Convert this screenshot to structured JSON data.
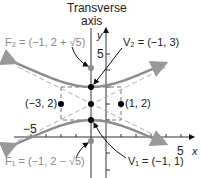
{
  "diagram": {
    "transverse_axis_label_line1": "Transverse",
    "transverse_axis_label_line2": "axis",
    "axis_labels": {
      "x": "x",
      "y": "y"
    },
    "tick_labels": {
      "y5": "5",
      "xneg5": "−5",
      "x5": "5"
    },
    "points": {
      "F2": {
        "label": "F₂ = (−1, 2 + √5)",
        "x": -1,
        "y": 4.236
      },
      "V2": {
        "label": "V₂ = (−1, 3)",
        "x": -1,
        "y": 3
      },
      "center": {
        "x": -1,
        "y": 2
      },
      "left": {
        "label": "(−3, 2)",
        "x": -3,
        "y": 2
      },
      "right": {
        "label": "(1, 2)",
        "x": 1,
        "y": 2
      },
      "V1": {
        "label": "V₁ = (−1, 1)",
        "x": -1,
        "y": 1
      },
      "F1": {
        "label": "F₁ = (−1, 2 − √5)",
        "x": -1,
        "y": -0.236
      }
    },
    "colors": {
      "curve": "#8c8c8c",
      "focus": "#8c8c8c",
      "point": "#000000",
      "text": "#222222",
      "focus_text": "#888888"
    }
  }
}
